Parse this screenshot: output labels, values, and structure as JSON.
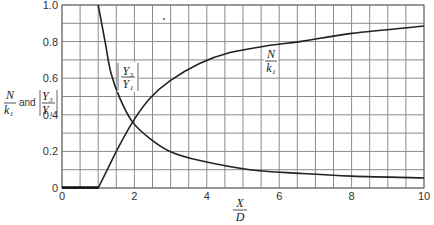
{
  "chart_data": {
    "type": "line",
    "title": "",
    "xlabel": "X/D",
    "ylabel": "N/k1 and |Y3/Y1|",
    "xlim": [
      0,
      10
    ],
    "ylim": [
      0,
      1.0
    ],
    "grid": true,
    "grid_x_step": 0.5,
    "grid_y_step": 0.1,
    "x_ticks": [
      "0",
      "2",
      "4",
      "6",
      "8",
      "10"
    ],
    "y_ticks": [
      "0",
      "0.2",
      "0.4",
      "0.6",
      "0.8",
      "1.0"
    ],
    "legend": "inline curve labels",
    "series": [
      {
        "name": "N/k1",
        "x": [
          0,
          1.0,
          1.5,
          1.95,
          2.43,
          2.98,
          3.8,
          4.64,
          5.75,
          6.57,
          8.0,
          10.0
        ],
        "y": [
          0,
          0,
          0.2,
          0.36,
          0.49,
          0.585,
          0.68,
          0.74,
          0.78,
          0.8,
          0.845,
          0.885
        ]
      },
      {
        "name": "|Y3/Y1|",
        "x": [
          1.0,
          1.19,
          1.35,
          1.6,
          1.95,
          2.43,
          2.98,
          3.81,
          5.19,
          6.57,
          8.0,
          10.0
        ],
        "y": [
          1.0,
          0.8,
          0.63,
          0.49,
          0.36,
          0.27,
          0.2,
          0.15,
          0.1,
          0.08,
          0.065,
          0.055
        ]
      }
    ],
    "annotations": [
      {
        "text": "N/k1",
        "x": 5.9,
        "y": 0.78
      },
      {
        "text": "|Y3/Y1|",
        "x": 1.6,
        "y": 0.52
      }
    ]
  },
  "labels": {
    "y_axis_num": "N",
    "y_axis_den": "k₁",
    "y_axis_and": "and",
    "y_axis_abs_num": "Y₃",
    "y_axis_abs_den": "Y₁",
    "x_axis_num": "X",
    "x_axis_den": "D",
    "curve1_num": "N",
    "curve1_den": "k₁",
    "curve2_num": "Y₃",
    "curve2_den": "Y₁"
  }
}
